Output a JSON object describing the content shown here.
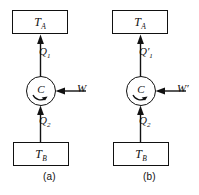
{
  "figure": {
    "type": "thermodynamic-cycle-diagram",
    "width": 199,
    "height": 195,
    "background_color": "#ffffff",
    "line_color": "#111111",
    "panel_count": 2
  },
  "panels": [
    {
      "id": "a",
      "caption": "(a)",
      "hot_reservoir": {
        "symbol": "T",
        "subscript": "A",
        "role": "hot-reservoir",
        "position": "top"
      },
      "cold_reservoir": {
        "symbol": "T",
        "subscript": "B",
        "role": "cold-reservoir",
        "position": "bottom"
      },
      "engine": {
        "label": "C",
        "shape": "circle",
        "rotation": "clockwise"
      },
      "heat_out": {
        "symbol": "Q",
        "subscript": "1",
        "prime": "",
        "direction": "up",
        "target": "hot-reservoir"
      },
      "heat_in": {
        "symbol": "Q",
        "subscript": "2",
        "prime": "",
        "direction": "up",
        "source": "cold-reservoir"
      },
      "work_in": {
        "symbol": "W",
        "subscript": "",
        "prime": "",
        "direction": "left",
        "target": "engine"
      }
    },
    {
      "id": "b",
      "caption": "(b)",
      "hot_reservoir": {
        "symbol": "T",
        "subscript": "A",
        "role": "hot-reservoir",
        "position": "top"
      },
      "cold_reservoir": {
        "symbol": "T",
        "subscript": "B",
        "role": "cold-reservoir",
        "position": "bottom"
      },
      "engine": {
        "label": "C",
        "shape": "circle",
        "rotation": "clockwise"
      },
      "heat_out": {
        "symbol": "Q",
        "subscript": "1",
        "prime": "′",
        "direction": "up",
        "target": "hot-reservoir"
      },
      "heat_in": {
        "symbol": "Q",
        "subscript": "2",
        "prime": "",
        "direction": "up",
        "source": "cold-reservoir"
      },
      "work_in": {
        "symbol": "W",
        "subscript": "",
        "prime": "′",
        "direction": "left",
        "target": "engine"
      }
    }
  ]
}
